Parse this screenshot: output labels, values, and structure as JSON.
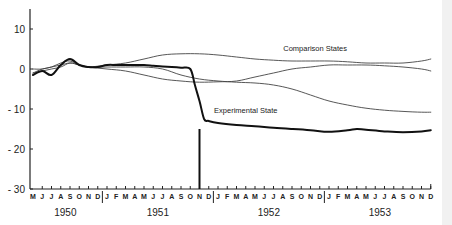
{
  "chart_data": {
    "type": "line",
    "title": "",
    "xlabel": "",
    "ylabel": "",
    "ylim": [
      -30,
      15
    ],
    "yticks": [
      10,
      0,
      -10,
      -20,
      -30
    ],
    "ytick_labels": [
      "10",
      "0",
      "- 10",
      "- 20",
      "- 30"
    ],
    "grid": false,
    "x_months": [
      "M",
      "J",
      "J",
      "A",
      "S",
      "O",
      "N",
      "D",
      "J",
      "F",
      "M",
      "A",
      "M",
      "J",
      "J",
      "A",
      "S",
      "O",
      "N",
      "D",
      "J",
      "F",
      "M",
      "A",
      "M",
      "J",
      "J",
      "A",
      "S",
      "O",
      "N",
      "D",
      "J",
      "F",
      "M",
      "A",
      "M",
      "J",
      "J",
      "A",
      "S",
      "O",
      "N",
      "D"
    ],
    "year_labels": [
      {
        "label": "1950",
        "month_index": 3.5
      },
      {
        "label": "1951",
        "month_index": 13.5
      },
      {
        "label": "1952",
        "month_index": 25.5
      },
      {
        "label": "1953",
        "month_index": 37.5
      }
    ],
    "year_dividers": [
      7.5,
      19.5,
      31.5
    ],
    "annotations": [
      {
        "text": "Comparison States",
        "month_index": 30.5,
        "value": 4.5
      },
      {
        "text": "Experimental State",
        "month_index": 23,
        "value": -11
      }
    ],
    "intervention_marker": {
      "month_index": 18,
      "from": -30,
      "to": -15
    },
    "series": [
      {
        "name": "Experimental State",
        "style": "bold",
        "x": [
          0,
          1,
          2,
          3,
          4,
          5,
          6,
          7,
          8,
          9,
          10,
          11,
          12,
          13,
          14,
          15,
          16,
          17,
          17.5,
          18,
          18.5,
          19,
          20,
          22,
          24,
          26,
          28,
          30,
          32,
          34,
          35,
          36,
          38,
          40,
          42,
          43
        ],
        "values": [
          -1.5,
          -0.5,
          -1.5,
          1.0,
          2.5,
          1.0,
          0.5,
          0.5,
          1.0,
          1.0,
          1.0,
          1.0,
          1.0,
          0.8,
          0.6,
          0.5,
          0.3,
          0.0,
          -4.0,
          -8.0,
          -12.5,
          -13.0,
          -13.5,
          -14.0,
          -14.3,
          -14.7,
          -15.0,
          -15.3,
          -15.7,
          -15.3,
          -15.0,
          -15.2,
          -15.6,
          -15.8,
          -15.6,
          -15.3
        ]
      },
      {
        "name": "Comparison State A",
        "style": "thin",
        "x": [
          0,
          1,
          2,
          3,
          4,
          5,
          6,
          8,
          10,
          12,
          14,
          16,
          18,
          20,
          22,
          24,
          26,
          28,
          30,
          32,
          34,
          36,
          38,
          40,
          42,
          43
        ],
        "values": [
          -1.0,
          0.0,
          0.5,
          1.5,
          2.0,
          1.0,
          0.5,
          1.0,
          1.5,
          2.5,
          3.5,
          3.8,
          3.8,
          3.5,
          3.0,
          2.5,
          2.2,
          2.0,
          2.0,
          2.0,
          1.8,
          1.5,
          1.5,
          1.5,
          2.0,
          2.5
        ]
      },
      {
        "name": "Comparison State B",
        "style": "thin",
        "x": [
          0,
          1,
          2,
          3,
          4,
          5,
          6,
          8,
          10,
          12,
          14,
          16,
          18,
          20,
          22,
          24,
          26,
          28,
          30,
          32,
          34,
          36,
          38,
          40,
          42,
          43
        ],
        "values": [
          0.0,
          0.0,
          0.5,
          1.0,
          1.5,
          1.0,
          0.5,
          0.5,
          0.5,
          0.5,
          0.0,
          -1.5,
          -2.5,
          -3.0,
          -3.3,
          -3.5,
          -4.0,
          -5.0,
          -6.5,
          -8.0,
          -9.0,
          -9.8,
          -10.3,
          -10.6,
          -10.8,
          -10.8
        ]
      },
      {
        "name": "Comparison State C",
        "style": "thin",
        "x": [
          0,
          1,
          2,
          3,
          4,
          5,
          6,
          8,
          10,
          12,
          14,
          16,
          18,
          20,
          22,
          24,
          26,
          28,
          30,
          32,
          34,
          36,
          38,
          40,
          42,
          43
        ],
        "values": [
          -1.0,
          -0.5,
          0.0,
          0.5,
          1.5,
          1.0,
          0.5,
          0.0,
          -0.5,
          -1.5,
          -2.5,
          -3.0,
          -3.3,
          -3.2,
          -3.0,
          -2.0,
          -1.0,
          0.0,
          0.5,
          1.0,
          1.0,
          1.0,
          0.8,
          0.5,
          0.0,
          -0.5
        ]
      }
    ]
  }
}
